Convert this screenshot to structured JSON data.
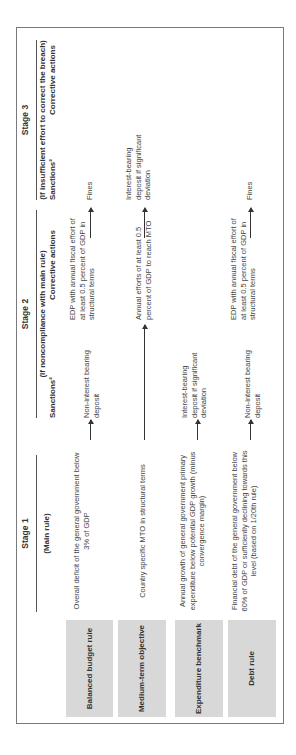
{
  "stages": [
    {
      "title": "Stage 1",
      "subtitle": "(Main rule)"
    },
    {
      "title": "Stage 2",
      "subtitle": "(If noncompliance with main rule)",
      "col_a": "Sanctions²",
      "col_b": "Corrective actions"
    },
    {
      "title": "Stage 3",
      "subtitle": "(If insufficient effort to correct the breach)",
      "col_a": "Sanctions²",
      "col_b": "Corrective actions"
    }
  ],
  "rows": [
    {
      "label": "Balanced budget rule",
      "main_rule": "Overall deficit of the general government below 3% of GDP",
      "s2_sanction": "Non-interest bearing deposit",
      "s2_corrective": "EDP with annual fiscal effort of at least 0.5 percent of GDP in structural terms",
      "s3_sanction": "Fines",
      "s3_corrective": ""
    },
    {
      "label": "Medium-term objective",
      "main_rule": "Country specific MTO in structural terms",
      "s2_sanction": "",
      "s2_corrective": "Annual efforts of at least 0.5 percent of GDP to reach MTO",
      "s3_sanction": "Interest-bearing deposit if significant deviation",
      "s3_corrective": ""
    },
    {
      "label": "Expenditure benchmark",
      "main_rule": "Annual growth of general government primary expenditure below potential GDP growth (minus convergence margin)",
      "s2_sanction": "Interest-bearing deposit if significant deviation",
      "s2_corrective": "",
      "s3_sanction": "",
      "s3_corrective": ""
    },
    {
      "label": "Debt rule",
      "main_rule": "Financial debt of the general government below 60% of GDP or sufficiently declining towards this level (based on 1/20th rule)",
      "s2_sanction": "Non-interest bearing deposit",
      "s2_corrective": "EDP with annual fiscal effort of at least 0.5 percent of GDP in structural terms",
      "s3_sanction": "Fines",
      "s3_corrective": ""
    }
  ],
  "colors": {
    "label_box": "#d8d8d8",
    "border": "#7a7a7a",
    "text": "#444444"
  }
}
